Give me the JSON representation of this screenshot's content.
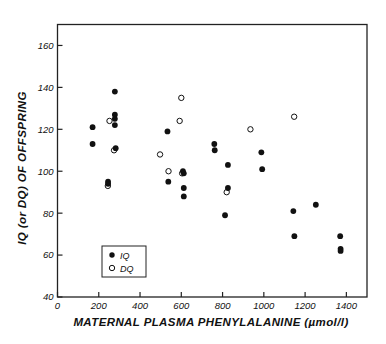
{
  "chart_data": {
    "type": "scatter",
    "title": "",
    "xlabel": "MATERNAL PLASMA PHENYLALANINE (µmol/l)",
    "ylabel": "IQ (or DQ) OF OFFSPRING",
    "xlim": [
      0,
      1500
    ],
    "ylim": [
      40,
      170
    ],
    "xticks": [
      0,
      200,
      400,
      600,
      800,
      1000,
      1200,
      1400
    ],
    "xtick_labels": [
      "0",
      "200",
      "400",
      "600",
      "800",
      "1000",
      "1200",
      "1400"
    ],
    "yticks": [
      40,
      60,
      80,
      100,
      120,
      140,
      160
    ],
    "ytick_labels": [
      "40",
      "60",
      "80",
      "100",
      "120",
      "140",
      "160"
    ],
    "grid": false,
    "legend_position": "lower-left-inside",
    "series": [
      {
        "name": "IQ",
        "marker": "filled-circle",
        "color": "#111111",
        "points": [
          [
            170,
            121
          ],
          [
            170,
            113
          ],
          [
            245,
            95
          ],
          [
            245,
            94
          ],
          [
            278,
            138
          ],
          [
            278,
            127
          ],
          [
            278,
            125
          ],
          [
            278,
            122
          ],
          [
            282,
            111
          ],
          [
            533,
            119
          ],
          [
            537,
            95
          ],
          [
            608,
            100
          ],
          [
            612,
            99
          ],
          [
            612,
            92
          ],
          [
            612,
            88
          ],
          [
            760,
            113
          ],
          [
            762,
            110
          ],
          [
            812,
            79
          ],
          [
            826,
            103
          ],
          [
            826,
            92
          ],
          [
            988,
            109
          ],
          [
            992,
            101
          ],
          [
            1143,
            81
          ],
          [
            1148,
            69
          ],
          [
            1252,
            84
          ],
          [
            1370,
            69
          ],
          [
            1372,
            63
          ],
          [
            1372,
            62
          ]
        ]
      },
      {
        "name": "DQ",
        "marker": "open-circle",
        "color": "#111111",
        "points": [
          [
            244,
            93
          ],
          [
            252,
            124
          ],
          [
            274,
            110
          ],
          [
            497,
            108
          ],
          [
            538,
            100
          ],
          [
            592,
            124
          ],
          [
            600,
            135
          ],
          [
            604,
            99
          ],
          [
            820,
            90
          ],
          [
            935,
            120
          ],
          [
            1147,
            126
          ]
        ]
      }
    ]
  },
  "legend": {
    "entries": [
      {
        "label": "IQ",
        "marker": "filled-circle"
      },
      {
        "label": "DQ",
        "marker": "open-circle"
      }
    ]
  },
  "style": {
    "axis_color": "#222222",
    "marker_color": "#111111",
    "background": "#ffffff"
  }
}
